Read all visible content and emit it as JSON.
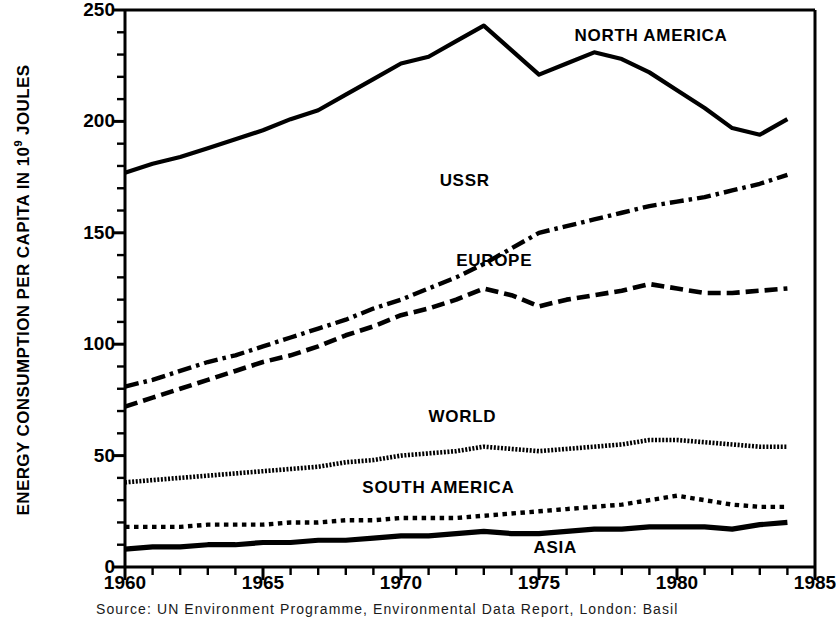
{
  "axis": {
    "y_title_main": "ENERGY CONSUMPTION PER CAPITA IN 10",
    "y_title_exp": "9",
    "y_title_tail": " JOULES",
    "y_ticks": [
      "0",
      "50",
      "100",
      "150",
      "200",
      "250"
    ],
    "x_ticks": [
      "1960",
      "1965",
      "1970",
      "1975",
      "1980",
      "1985"
    ]
  },
  "labels": {
    "north_america": "NORTH AMERICA",
    "ussr": "USSR",
    "europe": "EUROPE",
    "world": "WORLD",
    "south_america": "SOUTH AMERICA",
    "asia": "ASIA"
  },
  "source": {
    "text": "Source: UN Environment Programme, Environmental Data Report, London: Basil"
  },
  "chart_data": {
    "type": "line",
    "title": "",
    "xlabel": "",
    "ylabel": "ENERGY CONSUMPTION PER CAPITA IN 10^9 JOULES",
    "xlim": [
      1960,
      1985
    ],
    "ylim": [
      0,
      250
    ],
    "grid": false,
    "legend": "inline-annotations",
    "x_major_tick_step": 5,
    "x_minor_tick_step": 1,
    "y_major_tick_step": 50,
    "y_minor_tick_step": 10,
    "x": [
      1960,
      1961,
      1962,
      1963,
      1964,
      1965,
      1966,
      1967,
      1968,
      1969,
      1970,
      1971,
      1972,
      1973,
      1974,
      1975,
      1976,
      1977,
      1978,
      1979,
      1980,
      1981,
      1982,
      1983,
      1984
    ],
    "series": [
      {
        "name": "NORTH AMERICA",
        "style": "solid",
        "values": [
          177,
          181,
          184,
          188,
          192,
          196,
          201,
          205,
          212,
          219,
          226,
          229,
          236,
          243,
          232,
          221,
          226,
          231,
          228,
          222,
          214,
          206,
          197,
          194,
          201
        ]
      },
      {
        "name": "USSR",
        "style": "dash-dot",
        "values": [
          81,
          84,
          88,
          92,
          95,
          99,
          103,
          107,
          111,
          116,
          120,
          125,
          130,
          136,
          143,
          150,
          153,
          156,
          159,
          162,
          164,
          166,
          169,
          172,
          176
        ]
      },
      {
        "name": "EUROPE",
        "style": "dashed",
        "values": [
          72,
          76,
          80,
          84,
          88,
          92,
          95,
          99,
          104,
          108,
          113,
          116,
          120,
          125,
          122,
          117,
          120,
          122,
          124,
          127,
          125,
          123,
          123,
          124,
          125
        ]
      },
      {
        "name": "WORLD",
        "style": "fine-dotted",
        "values": [
          38,
          39,
          40,
          41,
          42,
          43,
          44,
          45,
          47,
          48,
          50,
          51,
          52,
          54,
          53,
          52,
          53,
          54,
          55,
          57,
          57,
          56,
          55,
          54,
          54
        ]
      },
      {
        "name": "SOUTH AMERICA",
        "style": "dotted",
        "values": [
          18,
          18,
          18,
          19,
          19,
          19,
          20,
          20,
          21,
          21,
          22,
          22,
          22,
          23,
          24,
          25,
          26,
          27,
          28,
          30,
          32,
          30,
          28,
          27,
          27
        ]
      },
      {
        "name": "ASIA",
        "style": "thick-solid",
        "values": [
          8,
          9,
          9,
          10,
          10,
          11,
          11,
          12,
          12,
          13,
          14,
          14,
          15,
          16,
          15,
          15,
          16,
          17,
          17,
          18,
          18,
          18,
          17,
          19,
          20
        ]
      }
    ]
  }
}
